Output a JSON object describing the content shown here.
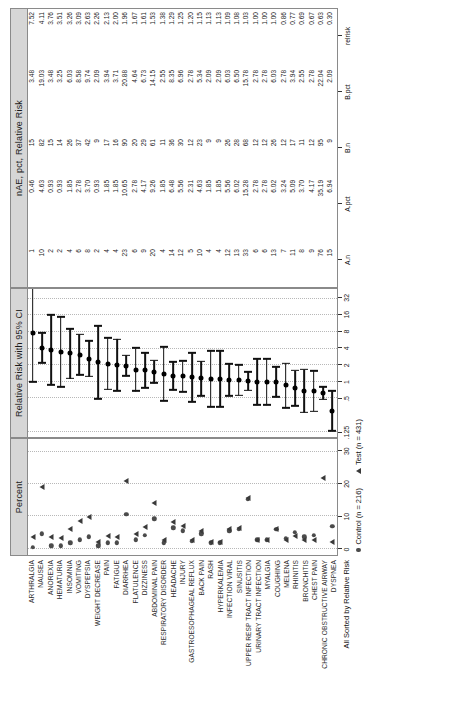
{
  "figure": {
    "label_axis_title": "All Sorted by Relative Risk",
    "panels": {
      "percent": {
        "title": "Percent",
        "ticks": [
          "0",
          "10",
          "20",
          "30"
        ],
        "tickvals": [
          0,
          10,
          20,
          30
        ],
        "xmin": -2,
        "xmax": 34
      },
      "forest": {
        "title": "Relative Risk with 95% CI",
        "ticks": [
          ".125",
          ".5",
          "1",
          "2",
          "4",
          "8",
          "16",
          "32"
        ],
        "tickvals": [
          0.125,
          0.5,
          1,
          2,
          4,
          8,
          16,
          32
        ]
      },
      "table": {
        "title": "nAE, pct, Relative Risk",
        "columns": [
          "A.n",
          "A.pct",
          "B.n",
          "B.pct",
          "relrisk"
        ]
      }
    },
    "legend": [
      {
        "marker": "circle",
        "label": "Control (n = 216)"
      },
      {
        "marker": "triangle",
        "label": "Test (n = 431)"
      }
    ],
    "colors": {
      "panel_header": "#d6d6d6",
      "border": "#8a8a8a",
      "marker": "#3a3a3a",
      "grid": "#c9c9c9"
    }
  },
  "chart_data": {
    "type": "scatter",
    "title": "All Sorted by Relative Risk",
    "xlabel": "Percent / Relative Risk with 95% CI",
    "ylabel": "Adverse Event",
    "legend": [
      "Control (n = 216)",
      "Test (n = 431)"
    ],
    "categories": [
      "ARTHRALGIA",
      "NAUSEA",
      "ANOREXIA",
      "HEMATURIA",
      "INSOMNIA",
      "VOMITING",
      "DYSPEPSIA",
      "WEIGHT DECREASE",
      "PAIN",
      "FATIGUE",
      "DIARRHEA",
      "FLATULENCE",
      "DIZZINESS",
      "ABDOMINAL PAIN",
      "RESPIRATORY DISORDER",
      "HEADACHE",
      "INJURY",
      "GASTROESOPHAGEAL REFLUX",
      "BACK PAIN",
      "RASH",
      "HYPERKALEMIA",
      "INFECTION VIRAL",
      "SINUSITIS",
      "UPPER RESP TRACT INFECTION",
      "URINARY TRACT INFECTION",
      "MYALGIA",
      "COUGHING",
      "MELENA",
      "RHINITIS",
      "BRONCHITIS",
      "CHEST PAIN",
      "CHRONIC OBSTRUCTIVE AIRWAY",
      "DYSPNEA"
    ],
    "rows": [
      {
        "event": "ARTHRALGIA",
        "a_n": 1,
        "a_pct": 0.46,
        "b_n": 15,
        "b_pct": 3.48,
        "relrisk": 7.52,
        "ci_low": 1.0,
        "ci_high": 56.4
      },
      {
        "event": "NAUSEA",
        "a_n": 10,
        "a_pct": 4.63,
        "b_n": 82,
        "b_pct": 19.03,
        "relrisk": 4.11,
        "ci_low": 2.18,
        "ci_high": 7.75
      },
      {
        "event": "ANOREXIA",
        "a_n": 2,
        "a_pct": 0.93,
        "b_n": 15,
        "b_pct": 3.48,
        "relrisk": 3.76,
        "ci_low": 0.87,
        "ci_high": 16.2
      },
      {
        "event": "HEMATURIA",
        "a_n": 2,
        "a_pct": 0.93,
        "b_n": 14,
        "b_pct": 3.25,
        "relrisk": 3.51,
        "ci_low": 0.81,
        "ci_high": 15.2
      },
      {
        "event": "INSOMNIA",
        "a_n": 4,
        "a_pct": 1.85,
        "b_n": 26,
        "b_pct": 6.03,
        "relrisk": 3.26,
        "ci_low": 1.15,
        "ci_high": 9.22
      },
      {
        "event": "VOMITING",
        "a_n": 6,
        "a_pct": 2.78,
        "b_n": 37,
        "b_pct": 8.58,
        "relrisk": 3.09,
        "ci_low": 1.32,
        "ci_high": 7.21
      },
      {
        "event": "DYSPEPSIA",
        "a_n": 8,
        "a_pct": 3.7,
        "b_n": 42,
        "b_pct": 9.74,
        "relrisk": 2.63,
        "ci_low": 1.26,
        "ci_high": 5.5
      },
      {
        "event": "WEIGHT DECREASE",
        "a_n": 2,
        "a_pct": 0.93,
        "b_n": 9,
        "b_pct": 2.09,
        "relrisk": 2.26,
        "ci_low": 0.49,
        "ci_high": 10.3
      },
      {
        "event": "PAIN",
        "a_n": 4,
        "a_pct": 1.85,
        "b_n": 17,
        "b_pct": 3.94,
        "relrisk": 2.13,
        "ci_low": 0.73,
        "ci_high": 6.24
      },
      {
        "event": "FATIGUE",
        "a_n": 4,
        "a_pct": 1.85,
        "b_n": 16,
        "b_pct": 3.71,
        "relrisk": 2.0,
        "ci_low": 0.68,
        "ci_high": 5.91
      },
      {
        "event": "DIARRHEA",
        "a_n": 23,
        "a_pct": 10.65,
        "b_n": 90,
        "b_pct": 20.88,
        "relrisk": 1.96,
        "ci_low": 1.28,
        "ci_high": 3.0
      },
      {
        "event": "FLATULENCE",
        "a_n": 6,
        "a_pct": 2.78,
        "b_n": 20,
        "b_pct": 4.64,
        "relrisk": 1.67,
        "ci_low": 0.68,
        "ci_high": 4.09
      },
      {
        "event": "DIZZINESS",
        "a_n": 9,
        "a_pct": 4.17,
        "b_n": 29,
        "b_pct": 6.73,
        "relrisk": 1.61,
        "ci_low": 0.78,
        "ci_high": 3.34
      },
      {
        "event": "ABDOMINAL PAIN",
        "a_n": 20,
        "a_pct": 9.26,
        "b_n": 61,
        "b_pct": 14.15,
        "relrisk": 1.53,
        "ci_low": 0.95,
        "ci_high": 2.46
      },
      {
        "event": "RESPIRATORY DISORDER",
        "a_n": 4,
        "a_pct": 1.85,
        "b_n": 11,
        "b_pct": 2.55,
        "relrisk": 1.38,
        "ci_low": 0.45,
        "ci_high": 4.26
      },
      {
        "event": "HEADACHE",
        "a_n": 14,
        "a_pct": 6.48,
        "b_n": 36,
        "b_pct": 8.35,
        "relrisk": 1.29,
        "ci_low": 0.71,
        "ci_high": 2.33
      },
      {
        "event": "INJURY",
        "a_n": 12,
        "a_pct": 5.56,
        "b_n": 30,
        "b_pct": 6.96,
        "relrisk": 1.25,
        "ci_low": 0.66,
        "ci_high": 2.38
      },
      {
        "event": "GASTROESOPHAGEAL REFLUX",
        "a_n": 5,
        "a_pct": 2.31,
        "b_n": 12,
        "b_pct": 2.78,
        "relrisk": 1.2,
        "ci_low": 0.43,
        "ci_high": 3.36
      },
      {
        "event": "BACK PAIN",
        "a_n": 10,
        "a_pct": 4.63,
        "b_n": 23,
        "b_pct": 5.34,
        "relrisk": 1.15,
        "ci_low": 0.56,
        "ci_high": 2.36
      },
      {
        "event": "RASH",
        "a_n": 4,
        "a_pct": 1.85,
        "b_n": 9,
        "b_pct": 2.09,
        "relrisk": 1.13,
        "ci_low": 0.35,
        "ci_high": 3.61
      },
      {
        "event": "HYPERKALEMIA",
        "a_n": 4,
        "a_pct": 1.85,
        "b_n": 9,
        "b_pct": 2.09,
        "relrisk": 1.13,
        "ci_low": 0.35,
        "ci_high": 3.61
      },
      {
        "event": "INFECTION VIRAL",
        "a_n": 12,
        "a_pct": 5.56,
        "b_n": 26,
        "b_pct": 6.03,
        "relrisk": 1.09,
        "ci_low": 0.56,
        "ci_high": 2.11
      },
      {
        "event": "SINUSITIS",
        "a_n": 13,
        "a_pct": 6.02,
        "b_n": 28,
        "b_pct": 6.5,
        "relrisk": 1.08,
        "ci_low": 0.57,
        "ci_high": 2.04
      },
      {
        "event": "UPPER RESP TRACT INFECTION",
        "a_n": 33,
        "a_pct": 15.28,
        "b_n": 68,
        "b_pct": 15.78,
        "relrisk": 1.03,
        "ci_low": 0.7,
        "ci_high": 1.52
      },
      {
        "event": "URINARY TRACT INFECTION",
        "a_n": 6,
        "a_pct": 2.78,
        "b_n": 12,
        "b_pct": 2.78,
        "relrisk": 1.0,
        "ci_low": 0.38,
        "ci_high": 2.63
      },
      {
        "event": "MYALGIA",
        "a_n": 6,
        "a_pct": 2.78,
        "b_n": 12,
        "b_pct": 2.78,
        "relrisk": 1.0,
        "ci_low": 0.38,
        "ci_high": 2.63
      },
      {
        "event": "COUGHING",
        "a_n": 13,
        "a_pct": 6.02,
        "b_n": 26,
        "b_pct": 6.03,
        "relrisk": 1.0,
        "ci_low": 0.53,
        "ci_high": 1.89
      },
      {
        "event": "MELENA",
        "a_n": 7,
        "a_pct": 3.24,
        "b_n": 12,
        "b_pct": 2.78,
        "relrisk": 0.86,
        "ci_low": 0.34,
        "ci_high": 2.15
      },
      {
        "event": "RHINITIS",
        "a_n": 11,
        "a_pct": 5.09,
        "b_n": 17,
        "b_pct": 3.94,
        "relrisk": 0.77,
        "ci_low": 0.37,
        "ci_high": 1.62
      },
      {
        "event": "BRONCHITIS",
        "a_n": 8,
        "a_pct": 3.7,
        "b_n": 11,
        "b_pct": 2.55,
        "relrisk": 0.69,
        "ci_low": 0.28,
        "ci_high": 1.69
      },
      {
        "event": "CHEST PAIN",
        "a_n": 9,
        "a_pct": 4.17,
        "b_n": 12,
        "b_pct": 2.78,
        "relrisk": 0.67,
        "ci_low": 0.29,
        "ci_high": 1.56
      },
      {
        "event": "CHRONIC OBSTRUCTIVE AIRWAY",
        "a_n": 76,
        "a_pct": 35.19,
        "b_n": 95,
        "b_pct": 22.04,
        "relrisk": 0.63,
        "ci_low": 0.48,
        "ci_high": 0.82
      },
      {
        "event": "DYSPNEA",
        "a_n": 15,
        "a_pct": 6.94,
        "b_n": 9,
        "b_pct": 2.09,
        "relrisk": 0.3,
        "ci_low": 0.13,
        "ci_high": 0.68
      }
    ]
  }
}
